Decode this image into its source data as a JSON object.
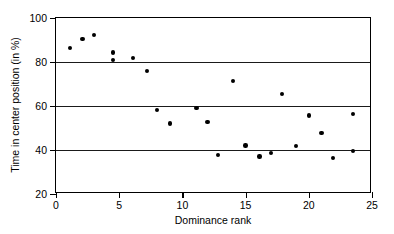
{
  "chart_data": {
    "type": "scatter",
    "title": "",
    "xlabel": "Dominance rank",
    "ylabel": "Time in center position (in %)",
    "xlim": [
      0,
      25
    ],
    "ylim": [
      20,
      100
    ],
    "xticks": [
      0,
      5,
      10,
      15,
      20,
      25
    ],
    "yticks": [
      20,
      40,
      60,
      80,
      100
    ],
    "grid": "horizontal",
    "legend": null,
    "marker": "filled-circle",
    "marker_color": "#000000",
    "points": [
      {
        "x": 1.1,
        "y": 86.5
      },
      {
        "x": 2.1,
        "y": 90.5
      },
      {
        "x": 3.0,
        "y": 92.4
      },
      {
        "x": 4.5,
        "y": 84.4
      },
      {
        "x": 4.5,
        "y": 81.0
      },
      {
        "x": 6.1,
        "y": 81.7
      },
      {
        "x": 7.2,
        "y": 75.9
      },
      {
        "x": 8.0,
        "y": 58.1
      },
      {
        "x": 9.0,
        "y": 52.1
      },
      {
        "x": 11.1,
        "y": 59.2
      },
      {
        "x": 12.0,
        "y": 52.7
      },
      {
        "x": 12.8,
        "y": 37.6
      },
      {
        "x": 14.0,
        "y": 71.5
      },
      {
        "x": 15.0,
        "y": 42.1
      },
      {
        "x": 16.1,
        "y": 37.1
      },
      {
        "x": 17.0,
        "y": 38.6
      },
      {
        "x": 17.9,
        "y": 65.4
      },
      {
        "x": 19.0,
        "y": 41.8
      },
      {
        "x": 20.0,
        "y": 55.6
      },
      {
        "x": 21.0,
        "y": 47.6
      },
      {
        "x": 21.9,
        "y": 36.5
      },
      {
        "x": 23.5,
        "y": 56.5
      },
      {
        "x": 23.5,
        "y": 39.5
      }
    ]
  }
}
